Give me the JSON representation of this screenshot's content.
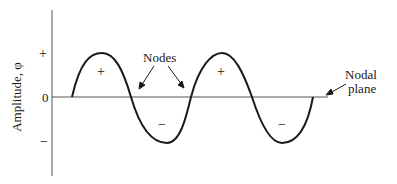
{
  "diagram": {
    "y_axis_label": "Amplitude, φ",
    "y_ticks": {
      "plus": "+",
      "zero": "0",
      "minus": "−"
    },
    "region_signs": [
      "+",
      "−",
      "+",
      "−"
    ],
    "annotations": {
      "nodes": "Nodes",
      "nodal_plane_line1": "Nodal",
      "nodal_plane_line2": "plane"
    },
    "colors": {
      "stroke": "#1a1a1a",
      "axis": "#555555"
    }
  }
}
